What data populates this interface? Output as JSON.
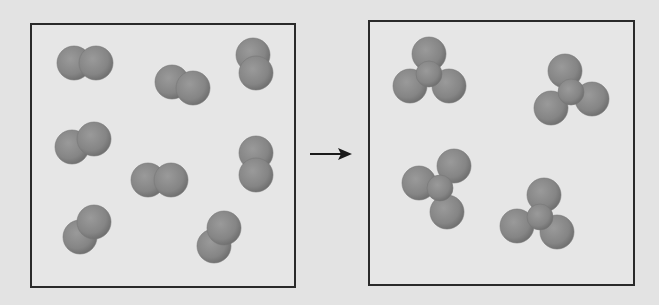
{
  "diagram": {
    "type": "reaction-particle-diagram",
    "colors": {
      "background": "#e3e3e3",
      "box_border": "#2a2a2a",
      "atom_fill": "#858585",
      "atom_shade": "#6a6a6a",
      "arrow": "#1a1a1a"
    },
    "reactants": {
      "label": "diatomic molecules",
      "count": 8,
      "molecules": [
        {
          "atoms": [
            [
              74,
              63
            ],
            [
              96,
              63
            ]
          ]
        },
        {
          "atoms": [
            [
              172,
              82
            ],
            [
              193,
              88
            ]
          ]
        },
        {
          "atoms": [
            [
              253,
              55
            ],
            [
              256,
              73
            ]
          ]
        },
        {
          "atoms": [
            [
              72,
              147
            ],
            [
              94,
              139
            ]
          ]
        },
        {
          "atoms": [
            [
              148,
              180
            ],
            [
              171,
              180
            ]
          ]
        },
        {
          "atoms": [
            [
              256,
              153
            ],
            [
              256,
              175
            ]
          ]
        },
        {
          "atoms": [
            [
              80,
              237
            ],
            [
              94,
              222
            ]
          ]
        },
        {
          "atoms": [
            [
              214,
              246
            ],
            [
              224,
              228
            ]
          ]
        }
      ]
    },
    "arrow": {
      "from": [
        310,
        154
      ],
      "to": [
        352,
        154
      ]
    },
    "products": {
      "label": "triatomic molecules",
      "count": 4,
      "molecules": [
        {
          "atoms": [
            [
              429,
              54
            ],
            [
              410,
              86
            ],
            [
              449,
              86
            ]
          ],
          "center": [
            429,
            74
          ]
        },
        {
          "atoms": [
            [
              565,
              71
            ],
            [
              551,
              108
            ],
            [
              592,
              99
            ]
          ],
          "center": [
            571,
            92
          ]
        },
        {
          "atoms": [
            [
              419,
              183
            ],
            [
              454,
              166
            ],
            [
              447,
              212
            ]
          ],
          "center": [
            440,
            188
          ]
        },
        {
          "atoms": [
            [
              544,
              195
            ],
            [
              517,
              226
            ],
            [
              557,
              232
            ]
          ],
          "center": [
            540,
            217
          ]
        }
      ]
    }
  }
}
